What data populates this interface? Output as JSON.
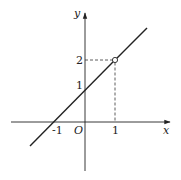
{
  "diagram": {
    "type": "function-graph",
    "function": "y = x + 1 (x ≠ 1)",
    "axes": {
      "x_label": "x",
      "y_label": "y",
      "origin_label": "O"
    },
    "ticks": {
      "x": [
        {
          "value": -1,
          "label": "-1"
        },
        {
          "value": 1,
          "label": "1"
        }
      ],
      "y": [
        {
          "value": 1,
          "label": "1"
        },
        {
          "value": 2,
          "label": "2"
        }
      ]
    },
    "open_point": {
      "x": 1,
      "y": 2
    },
    "guides": "dashed lines from (0,2) to (1,2) and from (1,2) to (1,0)",
    "colors": {
      "stroke": "#222222",
      "background": "#ffffff"
    }
  }
}
